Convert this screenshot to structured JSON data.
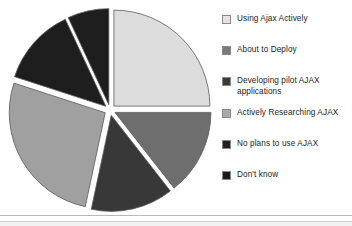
{
  "chart_data": {
    "type": "pie",
    "title": "",
    "exploded": true,
    "legend_position": "right",
    "categories": [
      "Using Ajax Actively",
      "About to Deploy",
      "Developing pilot AJAX applications",
      "Actively Researching AJAX",
      "No plans to use AJAX",
      "Don't know"
    ],
    "values": [
      25.0,
      14.5,
      14.0,
      26.5,
      13.0,
      7.0
    ],
    "slice_colors": [
      "#dcdcdc",
      "#6e6e6e",
      "#383838",
      "#a0a0a0",
      "#1e1e1e",
      "#1e1e1e"
    ],
    "slice_start_angles_deg": [
      0,
      90,
      142,
      192,
      288,
      335
    ],
    "slice_end_angles_deg": [
      90,
      142,
      192,
      288,
      335,
      360
    ],
    "xlabel": "",
    "ylabel": "",
    "grid": false
  },
  "legend": {
    "items": [
      {
        "label": "Using Ajax Actively",
        "swatch_color": "#e3e3e3",
        "top": 0
      },
      {
        "label": "About to Deploy",
        "swatch_color": "#7a7a7a",
        "top": 31
      },
      {
        "label": "Developing pilot AJAX\napplications",
        "swatch_color": "#3a3a3a",
        "top": 62
      },
      {
        "label": "Actively Researching AJAX",
        "swatch_color": "#a8a8a8",
        "top": 94
      },
      {
        "label": "No plans to use AJAX",
        "swatch_color": "#1f1f1f",
        "top": 125
      },
      {
        "label": "Don't know",
        "swatch_color": "#1a1a1a",
        "top": 156
      }
    ]
  },
  "style": {
    "background": "#ffffff",
    "slice_outline": "#5a5a5a",
    "rule_color": "#b8b8b8"
  }
}
